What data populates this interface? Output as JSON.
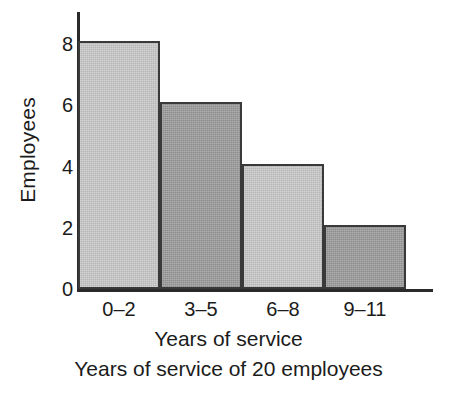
{
  "chart_data": {
    "type": "bar",
    "title": "",
    "caption": "Years of service of 20 employees",
    "xlabel": "Years of service",
    "ylabel": "Employees",
    "categories": [
      "0–2",
      "3–5",
      "6–8",
      "9–11"
    ],
    "values": [
      8,
      6,
      4,
      2
    ],
    "ylim": [
      0,
      8
    ],
    "yticks": [
      0,
      2,
      4,
      6,
      8
    ],
    "ytick_labels": [
      "0",
      "2",
      "4",
      "6",
      "8"
    ],
    "grid": false,
    "legend": null,
    "bar_colors": [
      "#c9c9c9",
      "#9b9b9b",
      "#c9c9c9",
      "#9b9b9b"
    ],
    "bar_edge_color": "#3a3a3a",
    "axis_color": "#2a2a2a",
    "bars": [
      {
        "category": "0–2",
        "value": 8,
        "shade": "light"
      },
      {
        "category": "3–5",
        "value": 6,
        "shade": "dark"
      },
      {
        "category": "6–8",
        "value": 4,
        "shade": "light"
      },
      {
        "category": "9–11",
        "value": 2,
        "shade": "dark"
      }
    ]
  }
}
